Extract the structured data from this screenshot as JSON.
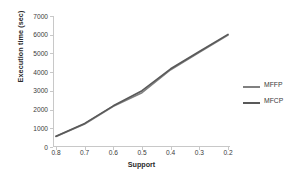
{
  "chart_data": {
    "type": "line",
    "title": "",
    "xlabel": "Support",
    "ylabel": "Execution time (sec)",
    "x": [
      0.8,
      0.7,
      0.6,
      0.5,
      0.4,
      0.3,
      0.2
    ],
    "xtick_labels": [
      "0.8",
      "0.7",
      "0.6",
      "0.5",
      "0.4",
      "0.3",
      "0.2"
    ],
    "ytick_labels": [
      "0",
      "1000",
      "2000",
      "3000",
      "4000",
      "5000",
      "6000",
      "7000"
    ],
    "ytick_values": [
      0,
      1000,
      2000,
      3000,
      4000,
      5000,
      6000,
      7000
    ],
    "ylim": [
      0,
      7000
    ],
    "xlim_order": "descending",
    "grid": false,
    "legend_position": "right",
    "series": [
      {
        "name": "MFFP",
        "color": "#808080",
        "values": [
          560,
          1230,
          2180,
          2900,
          4130,
          5060,
          5980
        ]
      },
      {
        "name": "MFCP",
        "color": "#595959",
        "values": [
          580,
          1260,
          2200,
          3010,
          4180,
          5100,
          6020
        ]
      }
    ]
  },
  "legend": {
    "items": [
      {
        "label": "MFFP"
      },
      {
        "label": "MFCP"
      }
    ]
  },
  "colors": {
    "axis": "#c8c8c8",
    "tick_text": "#3a3a3a",
    "title_text": "#2b2b2b",
    "background": "#ffffff"
  }
}
